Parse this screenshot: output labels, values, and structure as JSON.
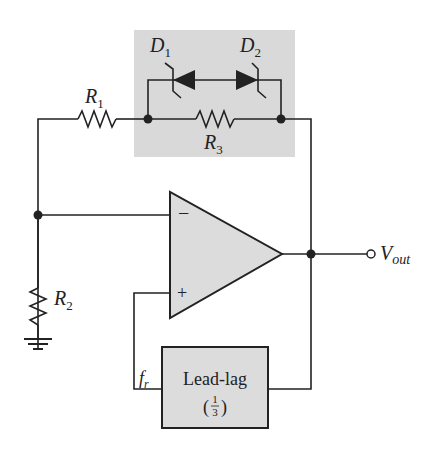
{
  "diagram": {
    "type": "circuit-schematic",
    "colors": {
      "wire": "#222222",
      "shade": "#d9d9d9",
      "opamp_fill": "#dcdcdc",
      "box_fill": "#dcdcdc"
    },
    "labels": {
      "d1": "D",
      "d1_sub": "1",
      "d2": "D",
      "d2_sub": "2",
      "r1": "R",
      "r1_sub": "1",
      "r2": "R",
      "r2_sub": "2",
      "r3": "R",
      "r3_sub": "3",
      "vout": "V",
      "vout_sub": "out",
      "fr": "f",
      "fr_sub": "r",
      "minus": "−",
      "plus": "+",
      "leadlag": "Lead-lag",
      "leadlag_gain_num": "1",
      "leadlag_gain_den": "3",
      "paren_open": "(",
      "paren_close": ")"
    },
    "components": [
      {
        "id": "R1",
        "kind": "resistor"
      },
      {
        "id": "R2",
        "kind": "resistor"
      },
      {
        "id": "R3",
        "kind": "resistor"
      },
      {
        "id": "D1",
        "kind": "zener-diode"
      },
      {
        "id": "D2",
        "kind": "zener-diode"
      },
      {
        "id": "U1",
        "kind": "op-amp"
      },
      {
        "id": "LL",
        "kind": "lead-lag-network",
        "gain": "1/3"
      },
      {
        "id": "GND",
        "kind": "ground"
      },
      {
        "id": "VOUT",
        "kind": "output-terminal"
      }
    ]
  }
}
